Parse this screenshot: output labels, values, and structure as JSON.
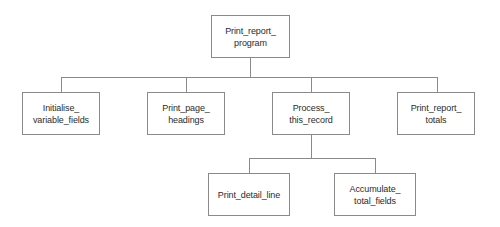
{
  "diagram": {
    "type": "structure-chart",
    "canvas": {
      "width": 500,
      "height": 227
    },
    "style": {
      "background_color": "#ffffff",
      "box_border_color": "#8a8a8a",
      "box_fill_color": "#ffffff",
      "connector_color": "#8a8a8a",
      "text_color": "#2b2b2b"
    },
    "nodes": [
      {
        "id": "print_report_program",
        "label": "Print_report_\nprogram",
        "level": 0,
        "x": 211,
        "y": 15,
        "w": 79,
        "h": 43
      },
      {
        "id": "initialise_variable_fields",
        "label": "Initialise_\nvariable_fields",
        "level": 1,
        "x": 22,
        "y": 92,
        "w": 78,
        "h": 43
      },
      {
        "id": "print_page_headings",
        "label": "Print_page_\nheadings",
        "level": 1,
        "x": 147,
        "y": 92,
        "w": 78,
        "h": 43
      },
      {
        "id": "process_this_record",
        "label": "Process_\nthis_record",
        "level": 1,
        "x": 272,
        "y": 92,
        "w": 78,
        "h": 43
      },
      {
        "id": "print_report_totals",
        "label": "Print_report_\ntotals",
        "level": 1,
        "x": 397,
        "y": 92,
        "w": 78,
        "h": 43
      },
      {
        "id": "print_detail_line",
        "label": "Print_detail_line",
        "level": 2,
        "x": 208,
        "y": 173,
        "w": 82,
        "h": 43
      },
      {
        "id": "accumulate_total_fields",
        "label": "Accumulate_\ntotal_fields",
        "level": 2,
        "x": 334,
        "y": 173,
        "w": 82,
        "h": 43
      }
    ],
    "connectors": [
      {
        "id": "root-drop",
        "from": "print_report_program",
        "x1": 250,
        "y1": 58,
        "x2": 250,
        "y2": 77
      },
      {
        "id": "level1-bus",
        "from": "print_report_program",
        "x1": 61,
        "y1": 77,
        "x2": 437,
        "y2": 77
      },
      {
        "id": "drop-initialise",
        "to": "initialise_variable_fields",
        "x1": 61,
        "y1": 77,
        "x2": 61,
        "y2": 92
      },
      {
        "id": "drop-headings",
        "to": "print_page_headings",
        "x1": 186,
        "y1": 77,
        "x2": 186,
        "y2": 92
      },
      {
        "id": "drop-process",
        "to": "process_this_record",
        "x1": 311,
        "y1": 77,
        "x2": 311,
        "y2": 92
      },
      {
        "id": "drop-totals",
        "to": "print_report_totals",
        "x1": 437,
        "y1": 77,
        "x2": 437,
        "y2": 92
      },
      {
        "id": "process-drop",
        "from": "process_this_record",
        "x1": 311,
        "y1": 135,
        "x2": 311,
        "y2": 158
      },
      {
        "id": "level2-bus",
        "from": "process_this_record",
        "x1": 249,
        "y1": 158,
        "x2": 375,
        "y2": 158
      },
      {
        "id": "drop-detail",
        "to": "print_detail_line",
        "x1": 249,
        "y1": 158,
        "x2": 249,
        "y2": 173
      },
      {
        "id": "drop-accumulate",
        "to": "accumulate_total_fields",
        "x1": 375,
        "y1": 158,
        "x2": 375,
        "y2": 173
      }
    ]
  }
}
